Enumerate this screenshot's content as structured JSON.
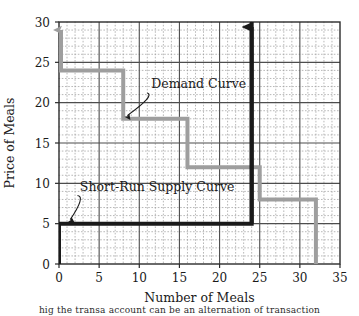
{
  "chart_data": {
    "type": "line",
    "title": "",
    "xlabel": "Number of Meals",
    "ylabel": "Price of Meals",
    "xlim": [
      0,
      35
    ],
    "ylim": [
      0,
      30
    ],
    "x_ticks": [
      0,
      5,
      10,
      15,
      20,
      25,
      30,
      35
    ],
    "y_ticks": [
      0,
      5,
      10,
      15,
      20,
      25,
      30
    ],
    "x_tick_labels": [
      "0",
      "5",
      "10",
      "15",
      "20",
      "25",
      "30",
      "35"
    ],
    "y_tick_labels": [
      "0",
      "5",
      "10",
      "15",
      "20",
      "25",
      "30"
    ],
    "grid": {
      "major_step_x": 5,
      "major_step_y": 5,
      "minor_step_x": 1,
      "minor_step_y": 1,
      "major_color": "#4d4d4d",
      "minor_color": "#9a9a9a",
      "minor_style": "dotted"
    },
    "legend_position": "none",
    "series": [
      {
        "name": "Demand Curve",
        "color": "#9e9e9e",
        "style": "step",
        "line_width": 4,
        "arrow_at_start": "up",
        "points": [
          {
            "x": 0,
            "y": 24
          },
          {
            "x": 8,
            "y": 24
          },
          {
            "x": 8,
            "y": 18
          },
          {
            "x": 16,
            "y": 18
          },
          {
            "x": 16,
            "y": 12
          },
          {
            "x": 25,
            "y": 12
          },
          {
            "x": 25,
            "y": 8
          },
          {
            "x": 32,
            "y": 8
          },
          {
            "x": 32,
            "y": 0
          }
        ]
      },
      {
        "name": "Short-Run Supply Curve",
        "color": "#1a1a1a",
        "style": "step",
        "line_width": 4,
        "arrow_at_end": "up",
        "points": [
          {
            "x": 0,
            "y": 0
          },
          {
            "x": 0,
            "y": 5
          },
          {
            "x": 24,
            "y": 5
          },
          {
            "x": 24,
            "y": 30
          }
        ]
      }
    ],
    "annotations": [
      {
        "id": "demand-annotation",
        "text": "Demand Curve",
        "label_x": 11.5,
        "label_y": 21.8,
        "arrow_from_x": 11.0,
        "arrow_from_y": 21.2,
        "arrow_to_x": 8.5,
        "arrow_to_y": 18.4
      },
      {
        "id": "supply-annotation",
        "text": "Short-Run Supply Curve",
        "label_x": 2.6,
        "label_y": 9.0,
        "arrow_from_x": 2.3,
        "arrow_from_y": 8.5,
        "arrow_to_x": 1.4,
        "arrow_to_y": 5.5
      }
    ]
  },
  "caption": {
    "text": "hig the transa account can be an alternation of transaction"
  }
}
